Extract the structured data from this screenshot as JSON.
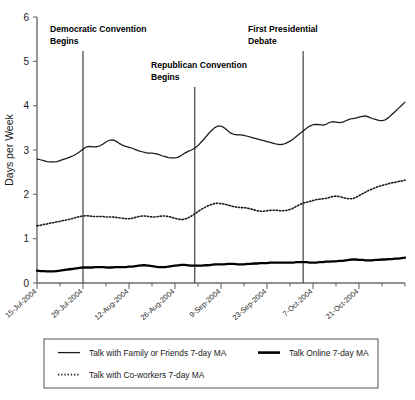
{
  "chart_data": {
    "type": "line",
    "title": "",
    "subtitle": "",
    "xlabel": "",
    "ylabel": "Days per Week",
    "ylim": [
      0,
      6
    ],
    "yticks": [
      0,
      1,
      2,
      3,
      4,
      5,
      6
    ],
    "ytick_labels": [
      "0",
      "1",
      "2",
      "3",
      "4",
      "5",
      "6"
    ],
    "grid": false,
    "legend_position": "below-axes",
    "xtick_labels": [
      "15-Jul-2004",
      "29-Jul-2004",
      "12-Aug-2004",
      "26-Aug-2004",
      "9-Sep-2004",
      "23-Sep-2004",
      "7-Oct-2004",
      "21-Oct-2004"
    ],
    "x_start_label": "15-Jul-2004",
    "x_end_label": "4-Nov-2004",
    "x_index_of_ticks": [
      0,
      14,
      28,
      42,
      56,
      70,
      84,
      98
    ],
    "n_points": 113,
    "series": [
      {
        "name": "Talk with Family or Friends 7-day MA",
        "style": "solid-thin",
        "values": [
          2.8,
          2.78,
          2.76,
          2.74,
          2.73,
          2.73,
          2.74,
          2.76,
          2.79,
          2.81,
          2.84,
          2.87,
          2.91,
          2.96,
          3.02,
          3.07,
          3.08,
          3.07,
          3.07,
          3.09,
          3.13,
          3.18,
          3.22,
          3.23,
          3.2,
          3.15,
          3.11,
          3.08,
          3.06,
          3.04,
          3.01,
          2.98,
          2.96,
          2.94,
          2.93,
          2.93,
          2.92,
          2.9,
          2.87,
          2.85,
          2.83,
          2.82,
          2.82,
          2.84,
          2.88,
          2.93,
          2.97,
          3.0,
          3.04,
          3.1,
          3.18,
          3.26,
          3.35,
          3.43,
          3.5,
          3.54,
          3.54,
          3.5,
          3.44,
          3.38,
          3.35,
          3.34,
          3.34,
          3.33,
          3.31,
          3.29,
          3.27,
          3.25,
          3.23,
          3.21,
          3.19,
          3.17,
          3.15,
          3.13,
          3.12,
          3.13,
          3.16,
          3.2,
          3.25,
          3.31,
          3.37,
          3.43,
          3.49,
          3.54,
          3.57,
          3.58,
          3.57,
          3.56,
          3.58,
          3.62,
          3.64,
          3.63,
          3.62,
          3.63,
          3.66,
          3.69,
          3.71,
          3.72,
          3.74,
          3.76,
          3.77,
          3.74,
          3.71,
          3.69,
          3.67,
          3.66,
          3.68,
          3.73,
          3.8,
          3.87,
          3.94,
          4.01,
          4.08
        ]
      },
      {
        "name": "Talk with Co-workers 7-day MA",
        "style": "dotted",
        "values": [
          1.29,
          1.3,
          1.32,
          1.33,
          1.35,
          1.36,
          1.38,
          1.39,
          1.41,
          1.42,
          1.44,
          1.46,
          1.48,
          1.5,
          1.51,
          1.52,
          1.51,
          1.5,
          1.5,
          1.5,
          1.5,
          1.49,
          1.49,
          1.49,
          1.48,
          1.47,
          1.46,
          1.45,
          1.45,
          1.46,
          1.48,
          1.5,
          1.51,
          1.51,
          1.5,
          1.49,
          1.49,
          1.5,
          1.51,
          1.51,
          1.5,
          1.48,
          1.46,
          1.44,
          1.43,
          1.44,
          1.47,
          1.51,
          1.56,
          1.61,
          1.66,
          1.7,
          1.74,
          1.77,
          1.79,
          1.8,
          1.79,
          1.78,
          1.76,
          1.74,
          1.72,
          1.71,
          1.7,
          1.7,
          1.69,
          1.67,
          1.65,
          1.63,
          1.62,
          1.62,
          1.63,
          1.64,
          1.64,
          1.64,
          1.63,
          1.63,
          1.64,
          1.66,
          1.69,
          1.73,
          1.77,
          1.8,
          1.82,
          1.84,
          1.86,
          1.88,
          1.89,
          1.9,
          1.91,
          1.93,
          1.95,
          1.96,
          1.95,
          1.93,
          1.91,
          1.9,
          1.9,
          1.93,
          1.97,
          2.01,
          2.05,
          2.09,
          2.12,
          2.15,
          2.18,
          2.2,
          2.22,
          2.24,
          2.26,
          2.27,
          2.29,
          2.3,
          2.32
        ]
      },
      {
        "name": "Talk Online 7-day MA",
        "style": "solid-thick",
        "values": [
          0.28,
          0.27,
          0.27,
          0.26,
          0.26,
          0.26,
          0.27,
          0.28,
          0.29,
          0.3,
          0.31,
          0.32,
          0.33,
          0.34,
          0.35,
          0.35,
          0.35,
          0.35,
          0.36,
          0.36,
          0.36,
          0.35,
          0.35,
          0.35,
          0.36,
          0.36,
          0.36,
          0.36,
          0.37,
          0.37,
          0.38,
          0.39,
          0.4,
          0.4,
          0.39,
          0.38,
          0.37,
          0.36,
          0.36,
          0.36,
          0.37,
          0.38,
          0.39,
          0.4,
          0.41,
          0.41,
          0.4,
          0.39,
          0.39,
          0.39,
          0.39,
          0.4,
          0.4,
          0.41,
          0.42,
          0.42,
          0.42,
          0.42,
          0.43,
          0.43,
          0.43,
          0.42,
          0.42,
          0.42,
          0.43,
          0.43,
          0.44,
          0.44,
          0.45,
          0.45,
          0.45,
          0.46,
          0.46,
          0.46,
          0.46,
          0.46,
          0.46,
          0.46,
          0.46,
          0.47,
          0.47,
          0.47,
          0.47,
          0.46,
          0.46,
          0.46,
          0.47,
          0.47,
          0.48,
          0.48,
          0.49,
          0.49,
          0.5,
          0.5,
          0.51,
          0.52,
          0.53,
          0.53,
          0.52,
          0.52,
          0.51,
          0.51,
          0.51,
          0.52,
          0.52,
          0.53,
          0.53,
          0.54,
          0.54,
          0.55,
          0.55,
          0.56,
          0.57
        ]
      }
    ],
    "annotations": [
      {
        "label_line1": "Democratic Convention",
        "label_line2": "Begins",
        "x_index": 14
      },
      {
        "label_line1": "Republican Convention",
        "label_line2": "Begins",
        "x_index": 48
      },
      {
        "label_line1": "First Presidential",
        "label_line2": "Debate",
        "x_index": 81
      }
    ],
    "legend": [
      {
        "name": "Talk with Family or Friends 7-day MA",
        "style": "solid-thin"
      },
      {
        "name": "Talk Online 7-day MA",
        "style": "solid-thick"
      },
      {
        "name": "Talk with Co-workers 7-day MA",
        "style": "dotted"
      }
    ],
    "colors": {
      "line": "#1a1a1a",
      "axis": "#6b6b6b",
      "event_line": "#4d4d4d",
      "background": "#ffffff"
    }
  }
}
